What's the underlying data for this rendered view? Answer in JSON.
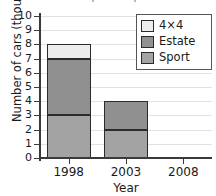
{
  "chart_data": {
    "type": "bar",
    "stacked": true,
    "title": "",
    "xlabel": "Year",
    "ylabel": "Number of cars (thousands)",
    "categories": [
      "1998",
      "2003",
      "2008"
    ],
    "series": [
      {
        "name": "Sport",
        "values": [
          3,
          2,
          0
        ],
        "color": "#a3a3a3"
      },
      {
        "name": "Estate",
        "values": [
          4,
          2,
          0
        ],
        "color": "#909090"
      },
      {
        "name": "4×4",
        "values": [
          1,
          0,
          0
        ],
        "color": "#ededed"
      }
    ],
    "totals": [
      8,
      4,
      0
    ],
    "ylim": [
      0,
      10
    ],
    "yticks": [
      "0",
      "1",
      "2",
      "3",
      "4",
      "5",
      "6",
      "7",
      "8",
      "9",
      "10"
    ],
    "ytick_values": [
      0,
      1,
      2,
      3,
      4,
      5,
      6,
      7,
      8,
      9,
      10
    ],
    "grid": true,
    "grid_axis": "y",
    "legend_position": "upper right",
    "legend": [
      {
        "label": "4×4",
        "color": "#ededed"
      },
      {
        "label": "Estate",
        "color": "#909090"
      },
      {
        "label": "Sport",
        "color": "#a3a3a3"
      }
    ],
    "colors": {
      "axis": "#3a3a3a",
      "grid": "#e2e2e2",
      "bar_outline": "#2b2b2b",
      "background": "#ffffff",
      "text": "#1a1a1a"
    }
  }
}
